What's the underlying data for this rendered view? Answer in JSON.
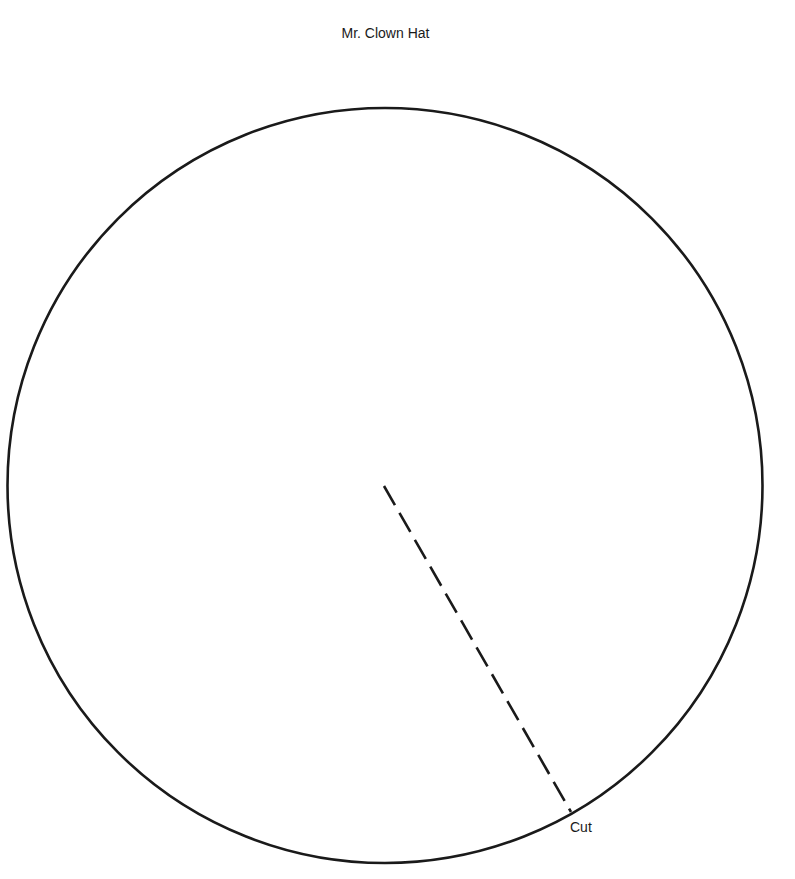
{
  "page": {
    "title": "Mr. Clown Hat",
    "cut_label": "Cut"
  },
  "template": {
    "shape": "circle",
    "center": [
      385,
      485
    ],
    "radius": 378,
    "stroke_color": "#1a1a1a",
    "cut_line": {
      "style": "dashed",
      "from": [
        384,
        486
      ],
      "to": [
        571,
        812
      ]
    }
  }
}
